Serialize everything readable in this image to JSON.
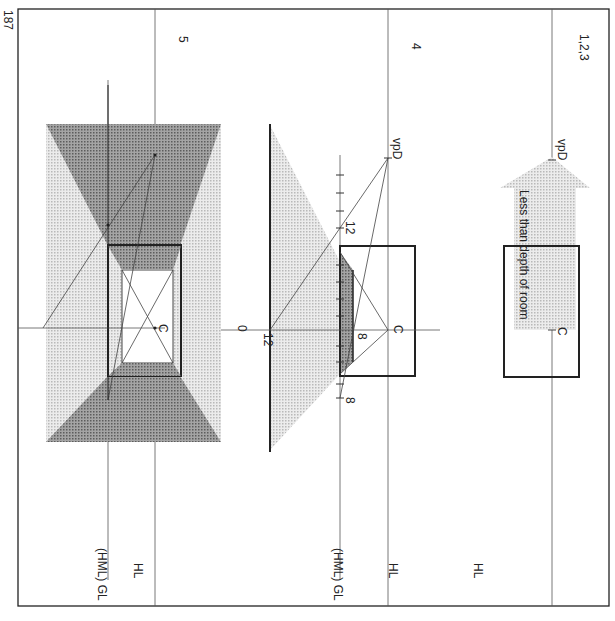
{
  "page": {
    "number": "187",
    "orientation": "rotated-90-clockwise"
  },
  "panels": [
    {
      "id": "1,2,3",
      "title": "1,2,3",
      "labels": {
        "horizon": "HL",
        "vanishing_point": "vpD",
        "center": "C",
        "arrow_text": "Less than depth of room"
      }
    },
    {
      "id": "4",
      "title": "4",
      "labels": {
        "horizon": "HL",
        "ground": "(HML) GL",
        "vanishing_point": "vpD",
        "center": "C",
        "tick_12_top": "12",
        "tick_12_bottom": "12",
        "tick_8_inner": "8",
        "tick_8_outer": "8",
        "zero": "0"
      }
    },
    {
      "id": "5",
      "title": "5",
      "labels": {
        "horizon": "HL",
        "ground": "(HML) GL",
        "center": "C"
      }
    }
  ],
  "colors": {
    "ink": "#222222",
    "light_tone": "#cfcfcf",
    "dark_tone": "#8a8a8a",
    "paper": "#ffffff"
  }
}
